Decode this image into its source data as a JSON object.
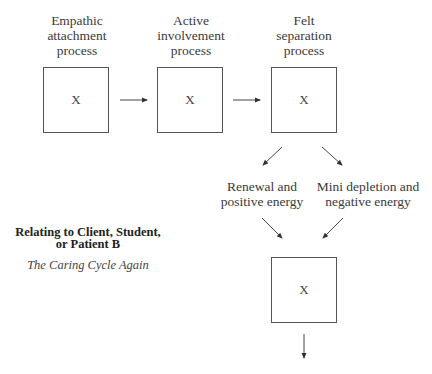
{
  "diagram": {
    "stages": [
      {
        "label_lines": [
          "Empathic",
          "attachment",
          "process"
        ],
        "box_text": "X"
      },
      {
        "label_lines": [
          "Active",
          "involvement",
          "process"
        ],
        "box_text": "X"
      },
      {
        "label_lines": [
          "Felt",
          "separation",
          "process"
        ],
        "box_text": "X"
      }
    ],
    "outcomes": [
      {
        "label_lines": [
          "Renewal and",
          "positive energy"
        ]
      },
      {
        "label_lines": [
          "Mini depletion and",
          "negative energy"
        ]
      }
    ],
    "final_box_text": "X",
    "title_lines": [
      "Relating to Client, Student,",
      "or Patient B"
    ],
    "subtitle": "The Caring Cycle Again",
    "edges": [
      {
        "from": "Empathic attachment process",
        "to": "Active involvement process"
      },
      {
        "from": "Active involvement process",
        "to": "Felt separation process"
      },
      {
        "from": "Felt separation process",
        "to": "Renewal and positive energy"
      },
      {
        "from": "Felt separation process",
        "to": "Mini depletion and negative energy"
      },
      {
        "from": "Renewal and positive energy",
        "to": "final box"
      },
      {
        "from": "Mini depletion and negative energy",
        "to": "final box"
      },
      {
        "from": "final box",
        "to": "(continues)"
      }
    ]
  }
}
